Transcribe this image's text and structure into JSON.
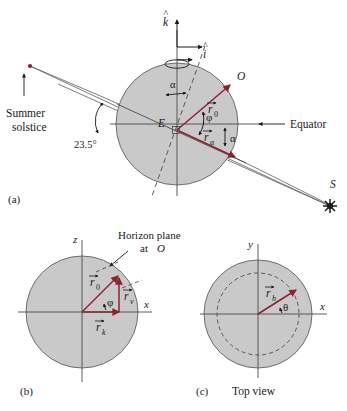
{
  "figure": {
    "panels": [
      {
        "key": "a",
        "label": "(a)",
        "caption": "",
        "annotations": {
          "summer_solstice": "Summer\nsolstice",
          "summer_solstice_line1": "Summer",
          "summer_solstice_line2": "solstice",
          "tilt_angle": "23.5°",
          "equator": "Equator",
          "earth_center": "E",
          "observer": "O",
          "sun_point": "S",
          "unit_vector_k": "k",
          "unit_vector_i": "i",
          "angle_phi": "φ",
          "angle_alpha_top": "α",
          "angle_alpha_bottom": "α",
          "vector_r0": "r",
          "vector_r0_sub": "0",
          "vector_ralpha": "r",
          "vector_ralpha_sub": "α"
        }
      },
      {
        "key": "b",
        "label": "(b)",
        "caption": "",
        "annotations": {
          "horizon_plane_line1": "Horizon plane",
          "horizon_plane_line2": "at",
          "horizon_plane_point": "O",
          "axis_z": "z",
          "axis_x": "x",
          "angle_phi": "φ",
          "vector_r0": "r",
          "vector_r0_sub": "0",
          "vector_rv": "r",
          "vector_rv_sub": "v",
          "vector_rk": "r",
          "vector_rk_sub": "k"
        }
      },
      {
        "key": "c",
        "label": "(c)",
        "caption": "Top view",
        "annotations": {
          "axis_y": "y",
          "axis_x": "x",
          "angle_theta": "θ",
          "vector_rh": "r",
          "vector_rh_sub": "h"
        }
      }
    ],
    "colors": {
      "vector_red": "#8c2230",
      "earth_fill": "#c9c9c9",
      "earth_stroke": "#6e6e6e",
      "line_gray": "#5a5a5a",
      "text": "#1a1a1a",
      "background": "#ffffff"
    },
    "icons": {
      "sun": "sun-starburst-icon",
      "rotation": "rotation-arrow-icon"
    }
  }
}
